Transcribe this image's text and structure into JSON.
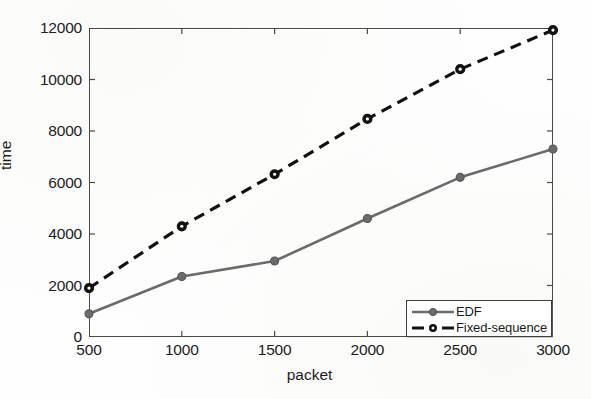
{
  "chart_data": {
    "type": "line",
    "title": "",
    "xlabel": "packet",
    "ylabel": "time",
    "x": [
      500,
      1000,
      1500,
      2000,
      2500,
      3000
    ],
    "categories": [
      "500",
      "1000",
      "1500",
      "2000",
      "2500",
      "3000"
    ],
    "xlim": [
      500,
      3000
    ],
    "ylim": [
      0,
      12000
    ],
    "xticks": [
      "500",
      "1000",
      "1500",
      "2000",
      "2500",
      "3000"
    ],
    "yticks": [
      "0",
      "2000",
      "4000",
      "6000",
      "8000",
      "10000",
      "12000"
    ],
    "ytick_values": [
      0,
      2000,
      4000,
      6000,
      8000,
      10000,
      12000
    ],
    "grid": false,
    "legend_position": "lower right",
    "series": [
      {
        "name": "EDF",
        "values": [
          900,
          2350,
          2950,
          4600,
          6200,
          7300
        ],
        "color": "#6b6b6b",
        "linestyle": "solid",
        "marker": "filled-circle"
      },
      {
        "name": "Fixed-sequence",
        "values": [
          1900,
          4300,
          6320,
          8470,
          10400,
          11920
        ],
        "color": "#111111",
        "linestyle": "dashed",
        "marker": "open-circle"
      }
    ]
  },
  "legend": {
    "entries": [
      {
        "label": "EDF"
      },
      {
        "label": "Fixed-sequence"
      }
    ]
  },
  "axes": {
    "frame_color": "#4a4a4a",
    "tick_color": "#4a4a4a"
  }
}
